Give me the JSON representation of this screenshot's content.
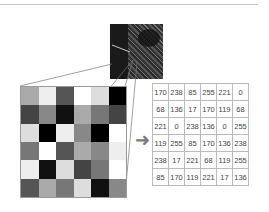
{
  "diagram": {
    "arrow_icon": "right-arrow-icon",
    "matrix": [
      [
        170,
        238,
        85,
        255,
        221,
        0
      ],
      [
        68,
        136,
        17,
        170,
        119,
        68
      ],
      [
        221,
        0,
        238,
        136,
        0,
        255
      ],
      [
        119,
        255,
        85,
        170,
        136,
        238
      ],
      [
        238,
        17,
        221,
        68,
        119,
        255
      ],
      [
        85,
        170,
        119,
        221,
        17,
        136
      ]
    ],
    "colors": {
      "grid_border": "#999999",
      "arrow": "#7a7a7a",
      "table_border": "#bbbbbb"
    }
  }
}
